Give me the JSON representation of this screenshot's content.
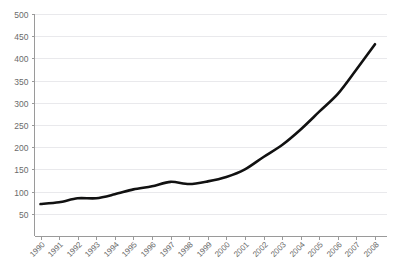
{
  "header": {
    "top_strip_left": "",
    "top_strip_right": ""
  },
  "chart_data": {
    "type": "line",
    "title": "",
    "subtitle": "",
    "xlabel": "",
    "ylabel": "",
    "categories": [
      "1990",
      "1991",
      "1992",
      "1993",
      "1994",
      "1995",
      "1996",
      "1997",
      "1998",
      "1999",
      "2000",
      "2001",
      "2002",
      "2003",
      "2004",
      "2005",
      "2006",
      "2007",
      "2008"
    ],
    "values": [
      72,
      76,
      85,
      85,
      94,
      105,
      112,
      122,
      117,
      123,
      133,
      150,
      178,
      205,
      240,
      280,
      320,
      375,
      432
    ],
    "series": [
      {
        "name": "series-1",
        "color": "#111111",
        "values": [
          72,
          76,
          85,
          85,
          94,
          105,
          112,
          122,
          117,
          123,
          133,
          150,
          178,
          205,
          240,
          280,
          320,
          375,
          432
        ]
      }
    ],
    "ylim": [
      0,
      500
    ],
    "ytick_values": [
      50,
      100,
      150,
      200,
      250,
      300,
      350,
      400,
      450,
      500
    ],
    "ytick_labels": [
      "50",
      "100",
      "150",
      "200",
      "250",
      "300",
      "350",
      "400",
      "450",
      "500"
    ],
    "xtick_labels": [
      "1990",
      "1991",
      "1992",
      "1993",
      "1994",
      "1995",
      "1996",
      "1997",
      "1998",
      "1999",
      "2000",
      "2001",
      "2002",
      "2003",
      "2004",
      "2005",
      "2006",
      "2007",
      "2008"
    ],
    "xtick_rotation": -45,
    "grid": true,
    "grid_axis": "y",
    "grid_color": "#e9e9ec",
    "legend": false,
    "legend_position": "none",
    "line_color": "#111111",
    "line_width": 2.6,
    "background_color": "#ffffff",
    "axis_color": "#9a9a9a",
    "tick_label_color": "#6b6b6b"
  }
}
